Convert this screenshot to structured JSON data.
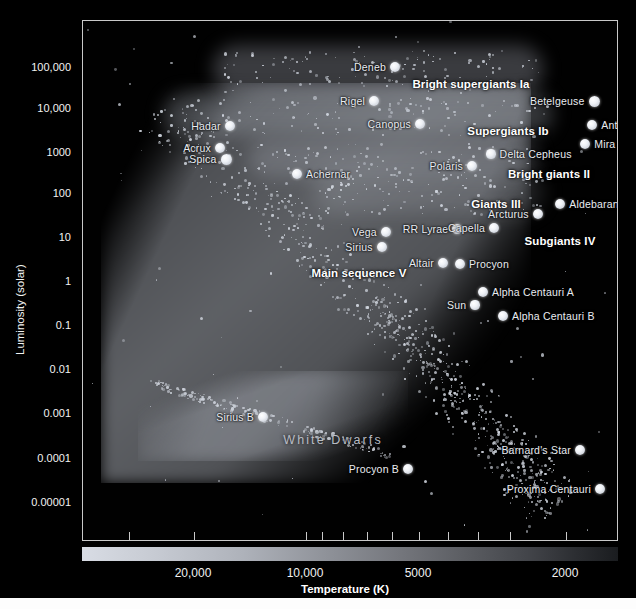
{
  "chart_data": {
    "type": "scatter",
    "xlabel": "Temperature (K)",
    "ylabel": "Luminosity (solar)",
    "x_scale": "log-reversed",
    "y_scale": "log",
    "xlim": [
      30000,
      1700
    ],
    "ylim": [
      3e-06,
      600000
    ],
    "grid": false,
    "legend": "none",
    "y_ticks": [
      "100,000",
      "10,000",
      "1000",
      "100",
      "10",
      "1",
      "0.1",
      "0.01",
      "0.001",
      "0.0001",
      "0.00001"
    ],
    "x_ticks": [
      "20,000",
      "10,000",
      "5000",
      "2000"
    ],
    "colorbar": {
      "present": true,
      "description": "temperature-color-strip",
      "left_color": "#d8dce4",
      "right_color": "#1a1c1f"
    },
    "luminosity_classes": [
      {
        "label": "Bright supergiants Ia",
        "x": 388,
        "y": 63
      },
      {
        "label": "Supergiants Ib",
        "x": 425,
        "y": 110
      },
      {
        "label": "Bright giants II",
        "x": 466,
        "y": 153
      },
      {
        "label": "Giants III",
        "x": 413,
        "y": 183
      },
      {
        "label": "Subgiants IV",
        "x": 477,
        "y": 220
      },
      {
        "label": "Main sequence V",
        "x": 276,
        "y": 252
      },
      {
        "label": "White Dwarfs",
        "x": 250,
        "y": 419
      }
    ],
    "stars": [
      {
        "name": "Deneb",
        "x": 312,
        "y": 46,
        "r": 5.0,
        "side": "r"
      },
      {
        "name": "Rigel",
        "x": 291,
        "y": 80,
        "r": 5.0,
        "side": "r"
      },
      {
        "name": "Betelgeuse",
        "x": 511,
        "y": 80,
        "r": 5.5,
        "side": "r"
      },
      {
        "name": "Canopus",
        "x": 337,
        "y": 103,
        "r": 5.0,
        "side": "r"
      },
      {
        "name": "Antares",
        "x": 509,
        "y": 104,
        "r": 5.2,
        "side": "l"
      },
      {
        "name": "Mira",
        "x": 502,
        "y": 123,
        "r": 5.2,
        "side": "l"
      },
      {
        "name": "Hadar",
        "x": 147,
        "y": 105,
        "r": 5.2,
        "side": "r"
      },
      {
        "name": "Acrux",
        "x": 137,
        "y": 127,
        "r": 5.0,
        "side": "r"
      },
      {
        "name": "Spica",
        "x": 143,
        "y": 138,
        "r": 5.5,
        "side": "r"
      },
      {
        "name": "Delta Cepheus",
        "x": 408,
        "y": 133,
        "r": 4.6,
        "side": "l"
      },
      {
        "name": "Polaris",
        "x": 389,
        "y": 145,
        "r": 5.0,
        "side": "r"
      },
      {
        "name": "Achernar",
        "x": 214,
        "y": 153,
        "r": 5.0,
        "side": "l"
      },
      {
        "name": "Aldebaran",
        "x": 477,
        "y": 183,
        "r": 5.2,
        "side": "l"
      },
      {
        "name": "Arcturus",
        "x": 455,
        "y": 193,
        "r": 5.2,
        "side": "r"
      },
      {
        "name": "RR Lyrae",
        "x": 374,
        "y": 208,
        "r": 4.6,
        "side": "r"
      },
      {
        "name": "Capella",
        "x": 411,
        "y": 207,
        "r": 5.0,
        "side": "r"
      },
      {
        "name": "Vega",
        "x": 303,
        "y": 211,
        "r": 5.2,
        "side": "r"
      },
      {
        "name": "Sirius",
        "x": 299,
        "y": 226,
        "r": 5.2,
        "side": "r"
      },
      {
        "name": "Altair",
        "x": 360,
        "y": 242,
        "r": 5.0,
        "side": "r"
      },
      {
        "name": "Procyon",
        "x": 377,
        "y": 243,
        "r": 5.0,
        "side": "l"
      },
      {
        "name": "Alpha Centauri A",
        "x": 400,
        "y": 271,
        "r": 5.0,
        "side": "l"
      },
      {
        "name": "Sun",
        "x": 392,
        "y": 284,
        "r": 4.6,
        "side": "r"
      },
      {
        "name": "Alpha Centauri B",
        "x": 420,
        "y": 295,
        "r": 5.0,
        "side": "l"
      },
      {
        "name": "Sirius B",
        "x": 180,
        "y": 396,
        "r": 5.0,
        "side": "r"
      },
      {
        "name": "Procyon B",
        "x": 325,
        "y": 448,
        "r": 5.0,
        "side": "r"
      },
      {
        "name": "Barnard's Star",
        "x": 497,
        "y": 429,
        "r": 5.0,
        "side": "r"
      },
      {
        "name": "Proxima Centauri",
        "x": 517,
        "y": 468,
        "r": 5.0,
        "side": "r"
      }
    ]
  },
  "axes": {
    "y_label": "Luminosity (solar)",
    "x_label": "Temperature (K)",
    "y_ticks": [
      {
        "label": "100,000",
        "top": 67
      },
      {
        "label": "10,000",
        "top": 108
      },
      {
        "label": "1000",
        "top": 152
      },
      {
        "label": "100",
        "top": 193
      },
      {
        "label": "10",
        "top": 237
      },
      {
        "label": "1",
        "top": 281
      },
      {
        "label": "0.1",
        "top": 325
      },
      {
        "label": "0.01",
        "top": 369
      },
      {
        "label": "0.001",
        "top": 413
      },
      {
        "label": "0.0001",
        "top": 458
      },
      {
        "label": "0.00001",
        "top": 502
      }
    ],
    "x_ticks": [
      {
        "label": "",
        "x": 128
      },
      {
        "label": "20,000",
        "x": 193
      },
      {
        "label": "",
        "x": 305
      },
      {
        "label": "",
        "x": 321
      },
      {
        "label": "",
        "x": 342
      },
      {
        "label": "",
        "x": 366
      },
      {
        "label": "",
        "x": 391
      },
      {
        "label": "",
        "x": 418
      },
      {
        "label": "",
        "x": 447
      },
      {
        "label": "",
        "x": 477
      },
      {
        "label": "",
        "x": 509
      },
      {
        "label": "",
        "x": 565
      }
    ],
    "x_tick_labels": [
      {
        "label": "20,000",
        "x": 193
      },
      {
        "label": "10,000",
        "x": 305
      },
      {
        "label": "5000",
        "x": 418
      },
      {
        "label": "2000",
        "x": 565
      }
    ]
  }
}
